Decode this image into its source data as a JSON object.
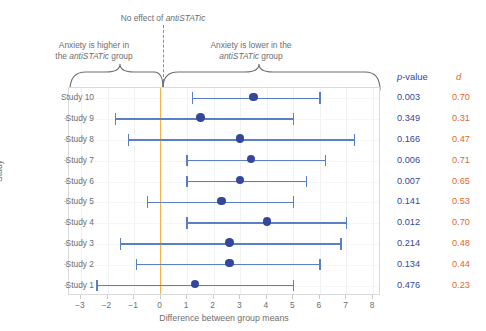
{
  "annotations": {
    "no_effect_prefix": "No effect of ",
    "no_effect_italic": "antiSTATic",
    "higher_line1": "Anxiety is higher in",
    "higher_line2_prefix": "the ",
    "higher_line2_italic": "antiSTATic",
    "higher_line2_suffix": " group",
    "lower_line1": "Anxiety is lower in the",
    "lower_line2_italic": "antiSTATic",
    "lower_line2_suffix": " group"
  },
  "axes": {
    "xlabel": "Difference between group means",
    "ylabel": "Study",
    "xticks": [
      "−3",
      "−2",
      "−1",
      "0",
      "1",
      "2",
      "3",
      "4",
      "5",
      "6",
      "7",
      "8"
    ],
    "xtick_values": [
      -3,
      -2,
      -1,
      0,
      1,
      2,
      3,
      4,
      5,
      6,
      7,
      8
    ],
    "xlim": [
      -3.45,
      8.3
    ],
    "zero_line_color": "#f0b64b",
    "point_color": "#33489b",
    "ci_color": "#5a7fc4"
  },
  "columns": {
    "p_italic": "p",
    "p_rest": "-value",
    "d": "d",
    "p_color": "#33489b",
    "d_color": "#e2682a"
  },
  "chart_data": {
    "type": "scatter",
    "title": "",
    "xlabel": "Difference between group means",
    "ylabel": "Study",
    "xlim": [
      -3.45,
      8.3
    ],
    "grid": true,
    "legend": "none",
    "reference_line": 0,
    "categories": [
      "Study 10",
      "Study 9",
      "Study 8",
      "Study 7",
      "Study 6",
      "Study 5",
      "Study 4",
      "Study 3",
      "Study 2",
      "Study 1"
    ],
    "rows": [
      {
        "study": "Study 10",
        "estimate": 3.5,
        "ci_low": 1.2,
        "ci_high": 6.0,
        "p": "0.003",
        "d": "0.70"
      },
      {
        "study": "Study 9",
        "estimate": 1.5,
        "ci_low": -1.7,
        "ci_high": 5.0,
        "p": "0.349",
        "d": "0.31"
      },
      {
        "study": "Study 8",
        "estimate": 3.0,
        "ci_low": -1.2,
        "ci_high": 7.3,
        "p": "0.166",
        "d": "0.47"
      },
      {
        "study": "Study 7",
        "estimate": 3.4,
        "ci_low": 1.0,
        "ci_high": 6.2,
        "p": "0.006",
        "d": "0.71"
      },
      {
        "study": "Study 6",
        "estimate": 3.0,
        "ci_low": 1.0,
        "ci_high": 5.5,
        "p": "0.007",
        "d": "0.65"
      },
      {
        "study": "Study 5",
        "estimate": 2.3,
        "ci_low": -0.5,
        "ci_high": 5.0,
        "p": "0.141",
        "d": "0.53"
      },
      {
        "study": "Study 4",
        "estimate": 4.0,
        "ci_low": 1.0,
        "ci_high": 7.0,
        "p": "0.012",
        "d": "0.70"
      },
      {
        "study": "Study 3",
        "estimate": 2.6,
        "ci_low": -1.5,
        "ci_high": 6.8,
        "p": "0.214",
        "d": "0.48"
      },
      {
        "study": "Study 2",
        "estimate": 2.6,
        "ci_low": -0.9,
        "ci_high": 6.0,
        "p": "0.134",
        "d": "0.44"
      },
      {
        "study": "Study 1",
        "estimate": 1.3,
        "ci_low": -2.4,
        "ci_high": 5.0,
        "p": "0.476",
        "d": "0.23"
      }
    ]
  }
}
